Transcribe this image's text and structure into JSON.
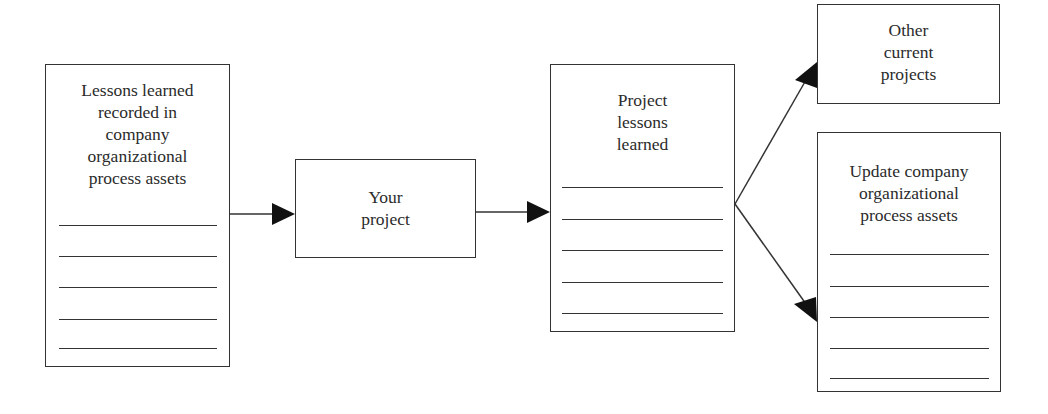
{
  "diagram": {
    "type": "flow",
    "nodes": [
      {
        "id": "org-assets-source",
        "label": "Lessons learned\nrecorded in\ncompany\norganizational\nprocess assets",
        "ruled_lines": 5
      },
      {
        "id": "your-project",
        "label": "Your\nproject",
        "ruled_lines": 0
      },
      {
        "id": "project-lessons",
        "label": "Project\nlessons\nlearned",
        "ruled_lines": 5
      },
      {
        "id": "other-projects",
        "label": "Other\ncurrent\nprojects",
        "ruled_lines": 0
      },
      {
        "id": "update-org-assets",
        "label": "Update company\norganizational\nprocess assets",
        "ruled_lines": 5
      }
    ],
    "edges": [
      {
        "from": "org-assets-source",
        "to": "your-project"
      },
      {
        "from": "your-project",
        "to": "project-lessons"
      },
      {
        "from": "project-lessons",
        "to": "other-projects"
      },
      {
        "from": "project-lessons",
        "to": "update-org-assets"
      }
    ],
    "colors": {
      "stroke": "#333333",
      "text": "#2b2b2b",
      "background": "#ffffff"
    }
  }
}
